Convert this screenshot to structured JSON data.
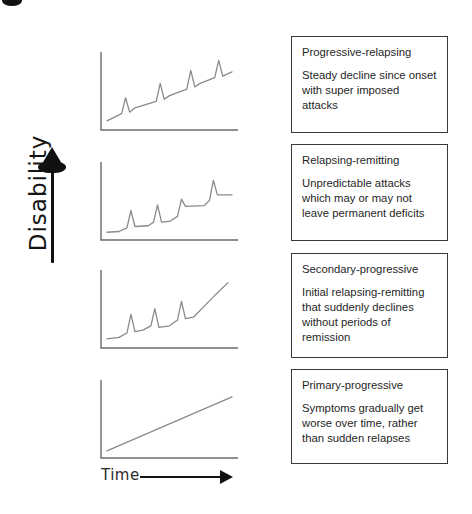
{
  "figure": {
    "axes": {
      "y_label": "Disability",
      "x_label": "Time",
      "y_arrow_icon": "up-arrow-icon",
      "x_arrow_icon": "right-arrow-icon"
    }
  },
  "panels": [
    {
      "id": "progressive-relapsing",
      "title": "Progressive-relapsing",
      "body": "Steady decline since onset with super imposed attacks"
    },
    {
      "id": "relapsing-remitting",
      "title": "Relapsing-remitting",
      "body": "Unpredictable attacks which may or may not leave permanent deficits"
    },
    {
      "id": "secondary-progressive",
      "title": "Secondary-progressive",
      "body": "Initial relapsing-remitting that suddenly declines without periods of remission"
    },
    {
      "id": "primary-progressive",
      "title": "Primary-progressive",
      "body": "Symptoms gradually get worse over time, rather than sudden relapses"
    }
  ],
  "chart_data": [
    {
      "type": "line",
      "title": "Progressive-relapsing",
      "xlabel": "Time",
      "ylabel": "Disability",
      "xlim": [
        0,
        100
      ],
      "ylim": [
        0,
        100
      ],
      "grid": false,
      "legend": null,
      "description": "Steadily rising baseline with four superimposed relapse spikes",
      "points": [
        [
          3,
          10
        ],
        [
          14,
          20
        ],
        [
          17,
          42
        ],
        [
          20,
          22
        ],
        [
          24,
          28
        ],
        [
          40,
          37
        ],
        [
          43,
          62
        ],
        [
          46,
          40
        ],
        [
          50,
          45
        ],
        [
          63,
          54
        ],
        [
          66,
          80
        ],
        [
          69,
          57
        ],
        [
          73,
          62
        ],
        [
          84,
          70
        ],
        [
          87,
          94
        ],
        [
          90,
          72
        ],
        [
          97,
          78
        ]
      ]
    },
    {
      "type": "line",
      "title": "Relapsing-remitting",
      "xlabel": "Time",
      "ylabel": "Disability",
      "xlim": [
        0,
        100
      ],
      "ylim": [
        0,
        100
      ],
      "grid": false,
      "legend": null,
      "description": "Flat baseline with discrete relapse spikes, each settling on a slightly higher plateau",
      "points": [
        [
          3,
          8
        ],
        [
          12,
          9
        ],
        [
          18,
          14
        ],
        [
          21,
          38
        ],
        [
          24,
          16
        ],
        [
          34,
          17
        ],
        [
          38,
          22
        ],
        [
          41,
          46
        ],
        [
          44,
          22
        ],
        [
          50,
          23
        ],
        [
          56,
          30
        ],
        [
          59,
          54
        ],
        [
          62,
          44
        ],
        [
          76,
          45
        ],
        [
          80,
          52
        ],
        [
          83,
          80
        ],
        [
          86,
          60
        ],
        [
          97,
          60
        ]
      ]
    },
    {
      "type": "line",
      "title": "Secondary-progressive",
      "xlabel": "Time",
      "ylabel": "Disability",
      "xlim": [
        0,
        100
      ],
      "ylim": [
        0,
        100
      ],
      "grid": false,
      "legend": null,
      "description": "Three early relapse spikes followed by a continuous upward progressive climb",
      "points": [
        [
          3,
          10
        ],
        [
          12,
          12
        ],
        [
          18,
          18
        ],
        [
          21,
          44
        ],
        [
          24,
          20
        ],
        [
          30,
          22
        ],
        [
          36,
          28
        ],
        [
          39,
          52
        ],
        [
          42,
          26
        ],
        [
          50,
          28
        ],
        [
          56,
          36
        ],
        [
          59,
          62
        ],
        [
          62,
          38
        ],
        [
          68,
          40
        ],
        [
          76,
          55
        ],
        [
          85,
          72
        ],
        [
          94,
          88
        ]
      ]
    },
    {
      "type": "line",
      "title": "Primary-progressive",
      "xlabel": "Time",
      "ylabel": "Disability",
      "xlim": [
        0,
        100
      ],
      "ylim": [
        0,
        100
      ],
      "grid": false,
      "legend": null,
      "description": "Single straight line of steadily increasing disability, no relapses",
      "points": [
        [
          3,
          7
        ],
        [
          97,
          82
        ]
      ]
    }
  ],
  "style": {
    "line_color": "#8a8a8a",
    "axis_color": "#6b6b6b",
    "box_border_color": "#3a3a3a",
    "text_color": "#1f1f1f",
    "arrow_color": "#111111",
    "background": "#ffffff"
  }
}
